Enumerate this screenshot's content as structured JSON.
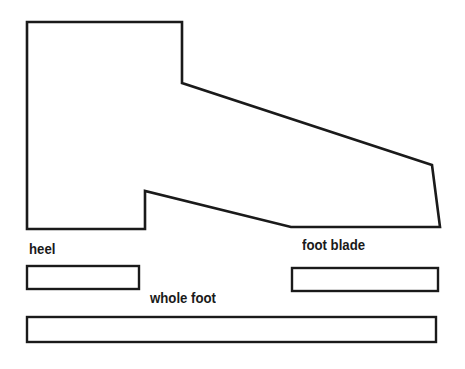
{
  "diagram": {
    "colors": {
      "stroke": "#1a1a1a",
      "background": "#ffffff"
    },
    "foot_outline": {
      "points": "27,22 182,22 182,83 432,165 440,227 291,227 145,191 145,229 27,229"
    },
    "segments": [
      {
        "id": "heel",
        "label": "heel",
        "bar": {
          "x": 27,
          "y": 266,
          "w": 112,
          "h": 23
        },
        "label_pos": {
          "x": 29,
          "y": 240
        }
      },
      {
        "id": "foot-blade",
        "label": "foot blade",
        "bar": {
          "x": 292,
          "y": 268,
          "w": 146,
          "h": 23
        },
        "label_pos": {
          "x": 302,
          "y": 236
        }
      },
      {
        "id": "whole-foot",
        "label": "whole foot",
        "bar": {
          "x": 27,
          "y": 317,
          "w": 409,
          "h": 25
        },
        "label_pos": {
          "x": 150,
          "y": 289
        }
      }
    ]
  }
}
